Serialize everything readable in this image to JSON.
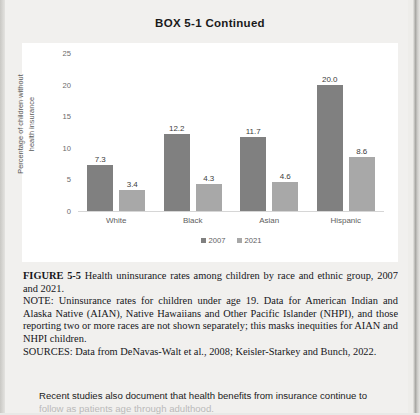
{
  "box": {
    "title": "BOX 5-1 Continued"
  },
  "chart_data": {
    "type": "bar",
    "title": "",
    "xlabel": "",
    "ylabel": "Percentage of children without health insurance",
    "ylabel_lines": [
      "Percentage of children without",
      "health insurance"
    ],
    "categories": [
      "White",
      "Black",
      "Asian",
      "Hispanic"
    ],
    "series": [
      {
        "name": "2007",
        "color": "#808080",
        "values": [
          7.3,
          12.2,
          11.7,
          20.0
        ],
        "labels": [
          "7.3",
          "12.2",
          "11.7",
          "20.0"
        ]
      },
      {
        "name": "2021",
        "color": "#a8a8a8",
        "values": [
          3.4,
          4.3,
          4.6,
          8.6
        ],
        "labels": [
          "3.4",
          "4.3",
          "4.6",
          "8.6"
        ]
      }
    ],
    "ylim": [
      0,
      25
    ],
    "yticks": [
      0,
      5,
      10,
      15,
      20,
      25
    ],
    "ytick_labels": [
      "0",
      "5",
      "10",
      "15",
      "20",
      "25"
    ],
    "grid": false,
    "legend_position": "bottom"
  },
  "caption": {
    "figure_label": "FIGURE 5-5",
    "figure_text": "Health uninsurance rates among children by race and ethnic group, 2007 and 2021.",
    "note": "NOTE: Uninsurance rates for children under age 19. Data for American Indian and Alaska Native (AIAN), Native Hawaiians and Other Pacific Islander (NHPI), and those reporting two or more races are not shown separately; this masks inequities for AIAN and NHPI children.",
    "sources": "SOURCES: Data from DeNavas-Walt et al., 2008; Keisler-Starkey and Bunch, 2022."
  },
  "body": {
    "paragraph_line_1": "Recent studies also document that health benefits from insurance continue to",
    "paragraph_line_2": "follow as patients age through adulthood."
  }
}
